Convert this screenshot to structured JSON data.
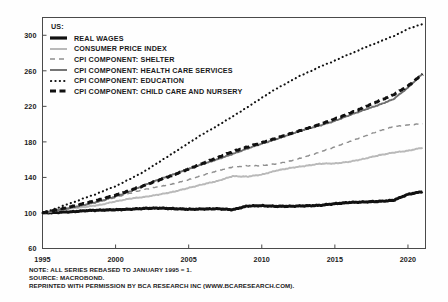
{
  "chart_data": {
    "type": "line",
    "title": "",
    "xlabel": "",
    "ylabel": "",
    "xlim": [
      1995,
      2021.2
    ],
    "ylim": [
      60,
      320
    ],
    "yticks": [
      60,
      100,
      140,
      180,
      220,
      260,
      300
    ],
    "xticks": [
      1995,
      2000,
      2005,
      2010,
      2015,
      2020
    ],
    "grid": false,
    "legend_position": "top-left",
    "legend_title": "US:",
    "note_rebase": "ALL SERIES REBASED TO JANUARY 1995 = 1",
    "x": [
      1995,
      1996,
      1997,
      1998,
      1999,
      2000,
      2001,
      2002,
      2003,
      2004,
      2005,
      2006,
      2007,
      2008,
      2009,
      2010,
      2011,
      2012,
      2013,
      2014,
      2015,
      2016,
      2017,
      2018,
      2019,
      2020,
      2021
    ],
    "series": [
      {
        "name": "REAL WAGES",
        "style": "solid",
        "width": "thick",
        "color": "#111111",
        "values": [
          100,
          100.6,
          101.4,
          102.6,
          103.2,
          103.6,
          104.2,
          105.2,
          105.4,
          104.8,
          104.2,
          104.4,
          104.8,
          103.6,
          107.8,
          108.2,
          107.4,
          107.6,
          108.0,
          108.6,
          110.4,
          111.8,
          112.4,
          113.0,
          114.2,
          121.0,
          124.0
        ]
      },
      {
        "name": "CONSUMER PRICE INDEX",
        "style": "solid",
        "width": "medium",
        "color": "#b9b9b9",
        "values": [
          100,
          102.9,
          105.3,
          106.9,
          109.3,
          113.0,
          116.2,
          118.1,
          120.8,
          124.0,
          128.2,
          132.3,
          136.1,
          141.4,
          140.9,
          143.2,
          147.7,
          150.8,
          153.0,
          155.5,
          155.7,
          157.6,
          161.0,
          164.9,
          167.9,
          170.0,
          173.5
        ]
      },
      {
        "name": "CPI COMPONENT: SHELTER",
        "style": "dashed",
        "width": "thin",
        "color": "#8e8e8e",
        "values": [
          100,
          103.0,
          106.3,
          109.6,
          113.4,
          117.6,
          122.3,
          126.6,
          129.6,
          132.9,
          137.4,
          142.7,
          147.7,
          151.7,
          153.1,
          153.3,
          155.2,
          158.6,
          163.2,
          168.6,
          174.4,
          180.4,
          186.3,
          192.1,
          197.0,
          199.0,
          200.5
        ]
      },
      {
        "name": "CPI COMPONENT: HEALTH CARE SERVICES",
        "style": "solid",
        "width": "medium",
        "color": "#6e6e6e",
        "values": [
          100,
          103.2,
          106.1,
          109.5,
          113.6,
          118.5,
          124.3,
          131.6,
          137.9,
          143.6,
          149.5,
          155.1,
          160.6,
          166.3,
          172.4,
          178.0,
          183.1,
          189.0,
          194.3,
          198.5,
          203.6,
          210.0,
          216.0,
          221.5,
          228.0,
          241.0,
          257.0
        ]
      },
      {
        "name": "CPI COMPONENT: EDUCATION",
        "style": "dotted",
        "width": "medium",
        "color": "#111111",
        "values": [
          100,
          105.6,
          111.4,
          117.4,
          123.6,
          130.2,
          138.2,
          147.2,
          157.4,
          168.2,
          178.8,
          189.0,
          198.6,
          208.4,
          219.0,
          229.6,
          239.8,
          249.0,
          257.2,
          264.6,
          271.6,
          278.8,
          285.8,
          292.4,
          299.0,
          307.0,
          313.0
        ]
      },
      {
        "name": "CPI COMPONENT: CHILD CARE AND NURSERY",
        "style": "dashed",
        "width": "thick",
        "color": "#111111",
        "values": [
          100,
          103.4,
          107.2,
          111.2,
          115.4,
          120.0,
          125.4,
          131.2,
          137.2,
          143.0,
          149.6,
          156.2,
          162.6,
          169.0,
          174.2,
          179.0,
          184.2,
          189.4,
          194.4,
          199.8,
          205.8,
          212.0,
          219.0,
          226.0,
          233.0,
          243.0,
          256.0
        ]
      }
    ]
  },
  "legend": {
    "title": "US:",
    "items": [
      {
        "label": "REAL WAGES",
        "swatch": "thick-solid-black"
      },
      {
        "label": "CONSUMER PRICE INDEX",
        "swatch": "solid-light-gray"
      },
      {
        "label": "CPI COMPONENT: SHELTER",
        "swatch": "dashed-gray"
      },
      {
        "label": "CPI COMPONENT: HEALTH CARE SERVICES",
        "swatch": "solid-gray"
      },
      {
        "label": "CPI COMPONENT: EDUCATION",
        "swatch": "dotted-black"
      },
      {
        "label": "CPI COMPONENT: CHILD CARE AND NURSERY",
        "swatch": "thick-dashed-black"
      }
    ]
  },
  "axes": {
    "y_ticks": [
      "300",
      "260",
      "220",
      "180",
      "140",
      "100",
      "60"
    ],
    "x_ticks": [
      "1995",
      "2000",
      "2005",
      "2010",
      "2015",
      "2020"
    ]
  },
  "footnotes": [
    "NOTE: ALL SERIES REBASED TO JANUARY 1995 = 1.",
    "SOURCE: MACROBOND.",
    "REPRINTED WITH PERMISSION BY BCA RESEARCH INC (WWW.BCARESEARCH.COM)."
  ],
  "colors": {
    "axis": "#4a4a4a",
    "text": "#1a1a1a",
    "background": "#fefefe"
  }
}
